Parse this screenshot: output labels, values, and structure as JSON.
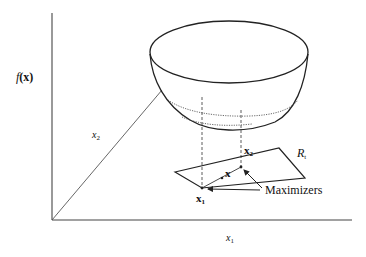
{
  "diagram": {
    "axes": {
      "vertical_label_func": "f",
      "vertical_label_arg": "(x)",
      "depth_label": "x",
      "depth_label_sub": "2",
      "horizontal_label": "x",
      "horizontal_label_sub": "1"
    },
    "region": {
      "label": "R",
      "label_sub": "t"
    },
    "points": {
      "x1_label": "x",
      "x1_sub": "1",
      "x2_label": "x",
      "x2_sub": "2",
      "x_label": "x"
    },
    "annotation": {
      "maximizers_label": "Maximizers"
    },
    "colors": {
      "stroke": "#222222",
      "background": "#ffffff"
    }
  }
}
